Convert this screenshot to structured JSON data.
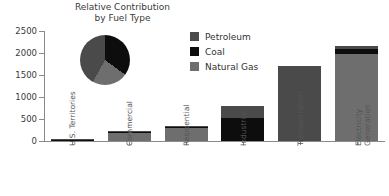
{
  "chart_data": {
    "type": "bar",
    "title": "Relative Contribution\nby Fuel Type",
    "xlabel": "",
    "ylabel": "",
    "ylim": [
      0,
      2500
    ],
    "ytick_values": [
      0,
      500,
      1000,
      1500,
      2000,
      2500
    ],
    "ytick_labels": [
      "0",
      "500",
      "1000",
      "1500",
      "2000",
      "2500"
    ],
    "grid": false,
    "stacked": true,
    "legend_position": "top-right",
    "categories": [
      "U.S. Territories",
      "Commercial",
      "Residential",
      "Industrial",
      "Transportation",
      "Electricity\nGeneration"
    ],
    "series": [
      {
        "name": "Petroleum",
        "color": "#4a4a4a",
        "values": [
          25,
          40,
          35,
          280,
          1700,
          60
        ]
      },
      {
        "name": "Coal",
        "color": "#0d0d0d",
        "values": [
          5,
          15,
          10,
          520,
          0,
          115
        ]
      },
      {
        "name": "Natural Gas",
        "color": "#6e6e6e",
        "values": [
          0,
          175,
          285,
          0,
          0,
          1975
        ]
      }
    ],
    "totals": [
      30,
      230,
      330,
      800,
      1700,
      2150
    ],
    "inset_pie": {
      "type": "pie",
      "labels": [
        "Coal",
        "Natural Gas",
        "Petroleum"
      ],
      "values": [
        35,
        23,
        42
      ],
      "colors": [
        "#0d0d0d",
        "#6e6e6e",
        "#4a4a4a"
      ]
    }
  },
  "legend": {
    "items": [
      {
        "label": "Petroleum",
        "color": "#4a4a4a"
      },
      {
        "label": "Coal",
        "color": "#0d0d0d"
      },
      {
        "label": "Natural Gas",
        "color": "#6e6e6e"
      }
    ]
  },
  "colors": {
    "petroleum": "#4a4a4a",
    "coal": "#0d0d0d",
    "natural_gas": "#6e6e6e",
    "axis": "#8a8a8a",
    "text": "#3a3a3a",
    "background": "#ffffff"
  }
}
